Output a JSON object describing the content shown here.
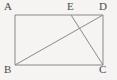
{
  "figure": {
    "kind": "geometry-diagram",
    "shape_name": "rectangle ABCD with point E on AD",
    "background_color": "#f5f4f2",
    "stroke_color": "#8a8a8a",
    "label_color": "#4a4a4a",
    "stroke_width": 1,
    "labels": {
      "A": "A",
      "B": "B",
      "C": "C",
      "D": "D",
      "E": "E"
    },
    "points": {
      "A": {
        "x": 15,
        "y": 15
      },
      "B": {
        "x": 15,
        "y": 65
      },
      "C": {
        "x": 103,
        "y": 65
      },
      "D": {
        "x": 103,
        "y": 15
      },
      "E": {
        "x": 71,
        "y": 15
      }
    },
    "segments": [
      {
        "name": "AD",
        "from": "A",
        "to": "D"
      },
      {
        "name": "AB",
        "from": "A",
        "to": "B"
      },
      {
        "name": "BC",
        "from": "B",
        "to": "C"
      },
      {
        "name": "CD",
        "from": "C",
        "to": "D"
      },
      {
        "name": "BD",
        "from": "B",
        "to": "D"
      },
      {
        "name": "EC",
        "from": "E",
        "to": "C"
      }
    ]
  }
}
